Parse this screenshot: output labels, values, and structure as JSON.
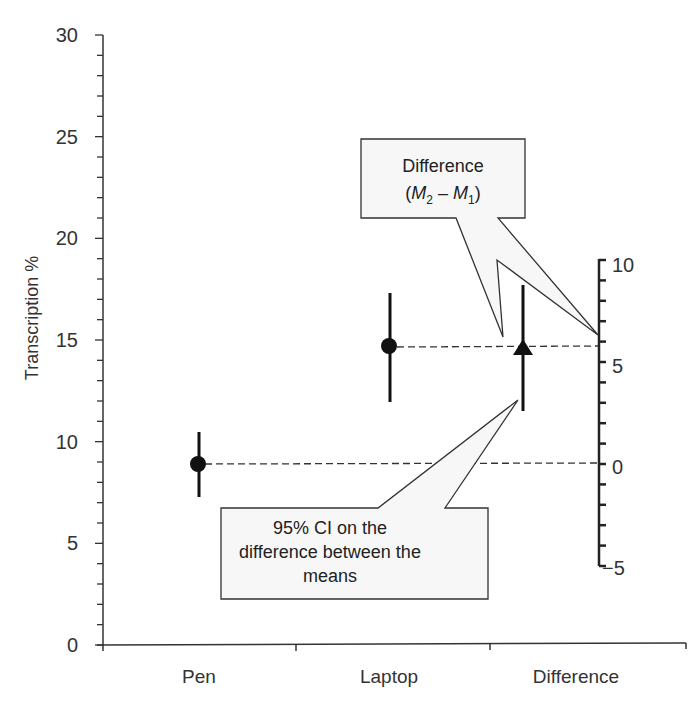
{
  "chart_data": {
    "type": "scatter",
    "subtype": "estimation-plot-with-error-bars",
    "title": "",
    "xlabel": "",
    "ylabel": "Transcription %",
    "categories": [
      "Pen",
      "Laptop",
      "Difference"
    ],
    "ylim": [
      0,
      30
    ],
    "yticks": [
      0,
      5,
      10,
      15,
      20,
      25,
      30
    ],
    "y_minor_tick_step": 1,
    "secondary_axis": {
      "label": "",
      "ylim": [
        -5,
        10
      ],
      "yticks": [
        -5,
        0,
        5,
        10
      ],
      "minor_tick_step": 1,
      "zero_aligned_to_primary": 8.9
    },
    "series": [
      {
        "name": "Pen",
        "marker": "circle",
        "mean": 8.9,
        "ci_low": 7.3,
        "ci_high": 10.6
      },
      {
        "name": "Laptop",
        "marker": "circle",
        "mean": 14.7,
        "ci_low": 12.0,
        "ci_high": 17.3
      },
      {
        "name": "Difference",
        "marker": "triangle",
        "axis": "secondary",
        "mean": 5.8,
        "ci_low": 2.7,
        "ci_high": 8.9
      }
    ],
    "reference_lines": [
      {
        "style": "dashed",
        "from": "Pen mean",
        "to": "secondary axis 0"
      },
      {
        "style": "dashed",
        "from": "Laptop mean",
        "to": "secondary axis 5.8"
      }
    ],
    "annotations": [
      {
        "text": "Difference (M2 – M1)",
        "points_to": [
          "Difference marker",
          "secondary axis at difference value"
        ]
      },
      {
        "text": "95% CI on the difference between the means",
        "points_to": "Difference error bar"
      }
    ],
    "grid": false,
    "legend": "none"
  },
  "axis": {
    "ylabel": "Transcription %",
    "left_ticks": [
      "0",
      "5",
      "10",
      "15",
      "20",
      "25",
      "30"
    ],
    "right_ticks": [
      "−5",
      "0",
      "5",
      "10"
    ],
    "categories": [
      "Pen",
      "Laptop",
      "Difference"
    ]
  },
  "callouts": {
    "difference": {
      "line1": "Difference",
      "open": "(",
      "m": "M",
      "sub2": "2",
      "dash": " – ",
      "sub1": "1",
      "close": ")"
    },
    "ci": {
      "line1": "95% CI on the",
      "line2": "difference between the",
      "line3": "means"
    }
  },
  "colors": {
    "ink": "#111111",
    "axis": "#333333",
    "callout_fill": "#f7f7f7",
    "callout_stroke": "#333333"
  }
}
